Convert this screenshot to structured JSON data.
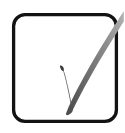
{
  "image": {
    "kind": "checkbox-checked-icon",
    "title": "Checked checkbox",
    "description": "Hand-drawn check mark inside a rounded square outline",
    "width": 125,
    "height": 133,
    "background_color": "#ffffff"
  },
  "checkbox": {
    "box": {
      "name": "checkbox-box",
      "state_label": "checked",
      "stroke_color": "#131313",
      "fill_color": "#ffffff",
      "stroke_width": 3.2,
      "corner_radius": 11,
      "x": 13.5,
      "y": 14.5,
      "width": 103,
      "height": 107
    },
    "check": {
      "name": "check-mark",
      "stroke_color": "#6f6f6f",
      "stroke_color_dark": "#3a3a3a",
      "stroke_color_light": "#a9a9a9",
      "short_arm_start_x": 62,
      "short_arm_start_y": 67,
      "vertex_x": 73,
      "vertex_y": 112,
      "long_arm_end_x": 123,
      "long_arm_end_y": 11,
      "overflows_box": "true"
    }
  }
}
